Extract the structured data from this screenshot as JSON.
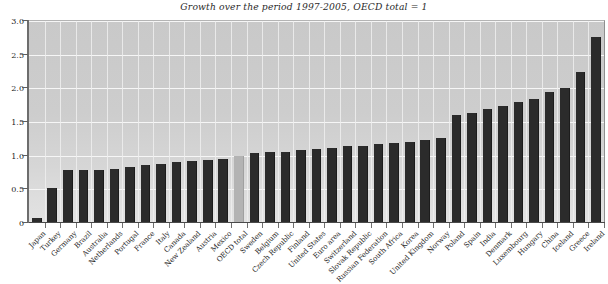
{
  "chart_data": {
    "type": "bar",
    "title": "Growth over the period 1997-2005, OECD total = 1",
    "xlabel": "",
    "ylabel": "",
    "ylim": [
      0,
      3.0
    ],
    "yticks": [
      0,
      0.5,
      1.0,
      1.5,
      2.0,
      2.5,
      3.0
    ],
    "ytick_labels": [
      "0",
      "0.5",
      "1.0",
      "1.5",
      "2.0",
      "2.5",
      "3.0"
    ],
    "grid": true,
    "legend": "none",
    "highlight_category": "OECD total",
    "highlight_value": 1.0,
    "bar_color": "#2b2b2b",
    "highlight_color": "#b3b3b3",
    "plot_background": "#cfcfcf",
    "gridline_color": "#f6f6f6",
    "categories": [
      "Japan",
      "Turkey",
      "Germany",
      "Brazil",
      "Australia",
      "Netherlands",
      "Portugal",
      "France",
      "Italy",
      "Canada",
      "New Zealand",
      "Austria",
      "Mexico",
      "OECD total",
      "Sweden",
      "Belgium",
      "Czech Republic",
      "Finland",
      "United States",
      "Euro area",
      "Switzerland",
      "Slovak Republic",
      "Russian Federation",
      "South Africa",
      "Korea",
      "United Kingdom",
      "Norway",
      "Poland",
      "Spain",
      "India",
      "Denmark",
      "Luxembourg",
      "Hungary",
      "China",
      "Iceland",
      "Greece",
      "Ireland"
    ],
    "values": [
      0.08,
      0.52,
      0.78,
      0.78,
      0.79,
      0.8,
      0.83,
      0.86,
      0.88,
      0.9,
      0.92,
      0.94,
      0.95,
      1.0,
      1.04,
      1.05,
      1.06,
      1.08,
      1.1,
      1.12,
      1.14,
      1.15,
      1.17,
      1.19,
      1.21,
      1.23,
      1.27,
      1.61,
      1.63,
      1.7,
      1.74,
      1.8,
      1.84,
      1.95,
      2.0,
      2.25,
      2.76
    ]
  }
}
